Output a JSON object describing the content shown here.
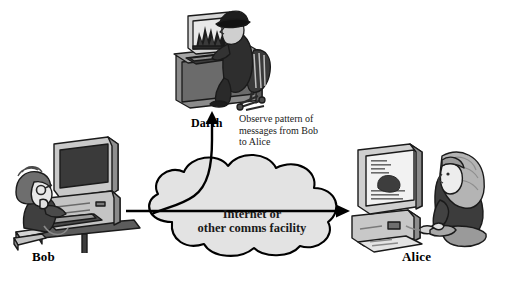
{
  "figure": {
    "type": "security-diagram",
    "background_color": "#ffffff",
    "line_color": "#000000",
    "fill_gray": "#d9d9d9"
  },
  "actors": {
    "bob": {
      "label": "Bob",
      "role": "sender",
      "position": "left",
      "scene": "boy with curly hair seated on stack of books at a desktop computer with CRT monitor, tower and keyboard"
    },
    "darth": {
      "label": "Darth",
      "role": "attacker",
      "position": "top-center",
      "scene": "man in dark coat and hat seated on office chair at a desk, monitor showing dark flame pattern"
    },
    "alice": {
      "label": "Alice",
      "role": "receiver",
      "position": "right",
      "scene": "woman with long hair seated at a monitor on a desktop case, holding a mouse, papers on the floor"
    }
  },
  "cloud": {
    "label": "Internet or\nother comms facility",
    "shape": "cloud"
  },
  "annotations": {
    "observe": "Observe pattern of\nmessages from Bob\nto Alice"
  },
  "arrows": {
    "bob_to_alice": {
      "from": "Bob",
      "to": "Alice",
      "style": "solid-horizontal-arrow"
    },
    "cloud_to_darth": {
      "from": "Internet or other comms facility",
      "to": "Darth",
      "style": "curved-arrow-up"
    }
  }
}
